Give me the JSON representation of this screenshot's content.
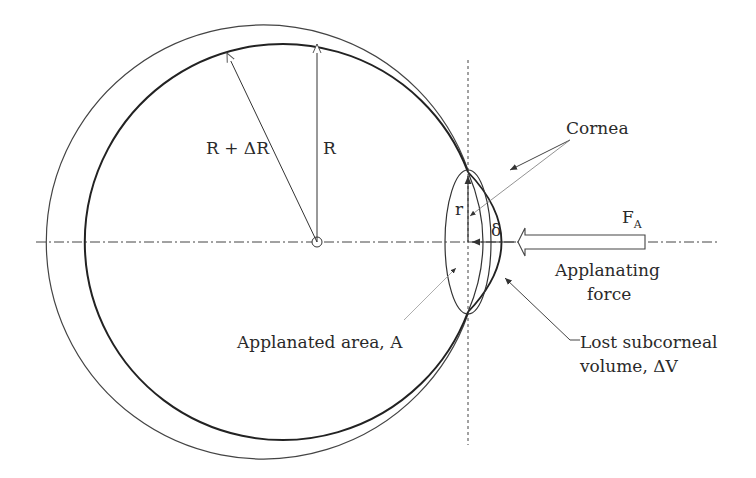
{
  "diagram": {
    "labels": {
      "r_plus_dr": "R + ΔR",
      "R": "R",
      "r": "r",
      "cornea": "Cornea",
      "delta": "δ",
      "force_symbol": "F",
      "force_subscript": "A",
      "applanating_force_1": "Applanating",
      "applanating_force_2": "force",
      "applanated_area": "Applanated area, A",
      "lost_volume_1": "Lost subcorneal",
      "lost_volume_2": "volume, ΔV"
    },
    "colors": {
      "line": "#333333",
      "light_line": "#9a9a9a",
      "text": "#2a2a2a"
    }
  }
}
